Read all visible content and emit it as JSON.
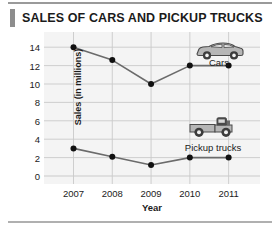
{
  "title": "SALES OF CARS AND PICKUP TRUCKS",
  "colors": {
    "line": "#6b6b6b",
    "marker": "#111111",
    "grid": "#c9c9c9",
    "plot_background": "#f4f4f4",
    "title_accent": "#8d8d8d",
    "text": "#1b1b1b",
    "icon_fill": "#b6b6b6",
    "icon_stroke": "#4a4a4a"
  },
  "annotations": {
    "cars_label": "Cars",
    "pickup_label": "Pickup trucks",
    "car_icon": "car-icon",
    "truck_icon": "pickup-truck-icon"
  },
  "chart_data": {
    "type": "line",
    "title": "SALES OF CARS AND PICKUP TRUCKS",
    "xlabel": "Year",
    "ylabel": "Sales (in millions)",
    "categories": [
      "2007",
      "2008",
      "2009",
      "2010",
      "2011"
    ],
    "x": [
      2007,
      2008,
      2009,
      2010,
      2011
    ],
    "xlim": [
      2006.6,
      2011.5
    ],
    "ylim": [
      0,
      15
    ],
    "yticks": [
      0,
      2,
      4,
      6,
      8,
      10,
      12,
      14
    ],
    "ytick_labels": [
      "0",
      "2",
      "4",
      "6",
      "8",
      "10",
      "12",
      "14"
    ],
    "xtick_labels": [
      "2007",
      "2008",
      "2009",
      "2010",
      "2011"
    ],
    "grid": true,
    "legend": "inline-annotations",
    "series": [
      {
        "name": "Cars",
        "values": [
          14,
          12.6,
          10,
          12,
          12
        ]
      },
      {
        "name": "Pickup trucks",
        "values": [
          3,
          2.1,
          1.2,
          2,
          2
        ]
      }
    ]
  }
}
